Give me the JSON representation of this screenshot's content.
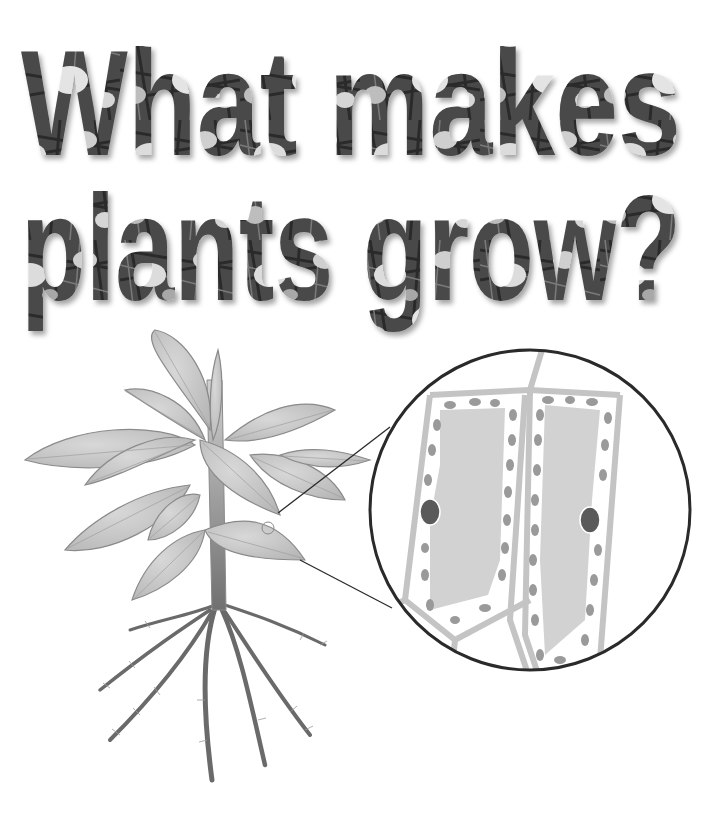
{
  "headline": {
    "line1": "What makes",
    "line2": "plants grow?",
    "style": "photo-textured condensed display type (poppy field image inside letters)"
  },
  "illustration": {
    "plant": {
      "label": "plant-diagram",
      "parts": [
        "leaves",
        "stem",
        "roots",
        "root-hairs"
      ]
    },
    "magnifier": {
      "label": "leaf-cell-magnification",
      "cells": [
        {
          "name": "left-cell",
          "has_nucleus": true
        },
        {
          "name": "right-cell",
          "has_nucleus": true
        }
      ],
      "organelles": [
        "chloroplasts",
        "nucleus",
        "vacuole",
        "cell-wall"
      ]
    },
    "colors": {
      "leaf_fill": "#c8c8c8",
      "leaf_stroke": "#8a8a8a",
      "cell_wall": "#c4c4c4",
      "chloroplast": "#9a9a9a",
      "vacuole": "#d2d2d2",
      "nucleus": "#5a5a5a",
      "magnifier_ring": "#2a2a2a",
      "root": "#6a6a6a"
    }
  }
}
